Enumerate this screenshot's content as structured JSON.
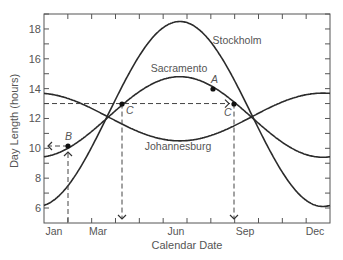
{
  "chart_data": {
    "type": "line",
    "title": "",
    "xlabel": "Calendar Date",
    "ylabel": "Day Length (hours)",
    "ylim": [
      5,
      19.5
    ],
    "yticks": [
      6,
      8,
      10,
      12,
      14,
      16,
      18
    ],
    "xtick_labels": [
      "Jan",
      "Mar",
      "Jun",
      "Sep",
      "Dec"
    ],
    "grid": false,
    "legend": "inline labels",
    "x_months": [
      1,
      2,
      3,
      4,
      5,
      6,
      7,
      8,
      9,
      10,
      11,
      12
    ],
    "series": [
      {
        "name": "Stockholm",
        "mean_hours": 12.3,
        "amplitude_hours": 6.2,
        "peak_month": 6.7,
        "values_start_of_month": [
          6.1,
          7.6,
          10.3,
          13.3,
          16.3,
          18.3,
          18.5,
          17.0,
          14.4,
          11.3,
          8.3,
          6.5
        ],
        "label_pos": [
          237,
          44
        ]
      },
      {
        "name": "Sacramento",
        "mean_hours": 12.1,
        "amplitude_hours": 2.7,
        "peak_month": 6.7,
        "values_start_of_month": [
          9.5,
          10.1,
          11.3,
          12.6,
          13.9,
          14.7,
          14.8,
          14.2,
          13.0,
          11.7,
          10.4,
          9.6
        ],
        "label_pos": [
          179,
          72
        ]
      },
      {
        "name": "Johannesburg",
        "mean_hours": 12.1,
        "amplitude_hours": -1.6,
        "peak_month": 6.7,
        "values_start_of_month": [
          13.7,
          13.4,
          12.6,
          11.8,
          11.1,
          10.6,
          10.5,
          10.9,
          11.6,
          12.5,
          13.2,
          13.6
        ],
        "label_pos": [
          178,
          150
        ]
      }
    ],
    "annotations": [
      {
        "label": "A",
        "point": [
          213,
          89
        ],
        "series": "Sacramento",
        "hours": 14.0
      },
      {
        "label": "B",
        "point": [
          68,
          146
        ],
        "series": "Sacramento",
        "hours": 10.2
      },
      {
        "label": "C",
        "point": [
          122,
          104
        ],
        "series": "Sacramento",
        "hours": 13.0
      },
      {
        "label": "C",
        "point": [
          234,
          104
        ],
        "series": "Sacramento",
        "hours": 13.0
      }
    ],
    "reference_lines": [
      {
        "type": "horizontal-dashed",
        "hours": 13,
        "from_x": 44,
        "to_x": 234,
        "arrow": "right"
      },
      {
        "type": "vertical-dashed",
        "x": 122,
        "from_hours": 13,
        "to": "axis",
        "arrow": "down"
      },
      {
        "type": "vertical-dashed",
        "x": 234,
        "from_hours": 13,
        "to": "axis",
        "arrow": "down"
      },
      {
        "type": "vertical-dashed",
        "x": 68,
        "from": "axis",
        "to_hours": 10.2,
        "arrow": "up"
      },
      {
        "type": "horizontal-arrow",
        "hours": 10.2,
        "from_x": 68,
        "to_x": 47,
        "arrow": "left"
      }
    ]
  },
  "labels": {
    "ylabel": "Day Length (hours)",
    "xlabel": "Calendar Date",
    "point_a": "A",
    "point_b": "B",
    "point_c1": "C",
    "point_c2": "C"
  }
}
